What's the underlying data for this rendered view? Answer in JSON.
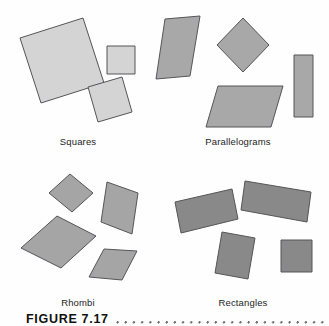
{
  "figure": {
    "caption_label": "FIGURE 7.17",
    "width": 329,
    "height": 326,
    "background_color": "#fefefe",
    "outline_color": "#55555a",
    "label_color": "#1d1d1d"
  },
  "panels": [
    {
      "id": "squares",
      "label": "Squares",
      "label_x": 78,
      "label_y": 136,
      "fill_color": "#d4d4d4",
      "shape_count": 3,
      "shapes": [
        {
          "name": "large-tilted-square",
          "points": "20,38 83,18 104,83 41,103"
        },
        {
          "name": "small-upright-square",
          "points": "107,46 135,46 135,74 107,74"
        },
        {
          "name": "medium-tilted-square",
          "points": "88,87 122,77 132,112 98,122"
        }
      ]
    },
    {
      "id": "parallelograms",
      "label": "Parallelograms",
      "label_x": 238,
      "label_y": 136,
      "fill_color": "#a8a8a8",
      "shape_count": 4,
      "shapes": [
        {
          "name": "steep-parallelogram",
          "points": "165,19 200,16 190,76 156,79"
        },
        {
          "name": "diamond-parallelogram",
          "points": "243,18 269,45 243,72 217,45"
        },
        {
          "name": "wide-parallelogram",
          "points": "218,86 283,86 271,127 206,127"
        },
        {
          "name": "tall-thin-rectangle",
          "points": "294,55 313,55 313,117 294,117"
        }
      ]
    },
    {
      "id": "rhombi",
      "label": "Rhombi",
      "label_x": 78,
      "label_y": 297,
      "fill_color": "#a5a5a5",
      "shape_count": 4,
      "shapes": [
        {
          "name": "small-rhombus",
          "points": "70,174 93,193 72,212 49,193"
        },
        {
          "name": "tall-rhombus",
          "points": "107,182 138,193 132,234 101,222"
        },
        {
          "name": "large-rhombus",
          "points": "57,216 96,236 61,268 21,248"
        },
        {
          "name": "slanted-rhombus",
          "points": "104,249 137,251 122,280 89,277"
        }
      ]
    },
    {
      "id": "rectangles",
      "label": "Rectangles",
      "label_x": 243,
      "label_y": 297,
      "fill_color": "#898989",
      "shape_count": 4,
      "shapes": [
        {
          "name": "tilted-rectangle-left",
          "points": "175,202 232,189 238,219 181,233"
        },
        {
          "name": "long-tilted-rectangle",
          "points": "245,181 311,192 307,222 241,210"
        },
        {
          "name": "tilted-square-center",
          "points": "222,232 255,238 248,279 215,273"
        },
        {
          "name": "upright-square-right",
          "points": "281,240 312,240 312,272 281,272"
        }
      ]
    }
  ]
}
